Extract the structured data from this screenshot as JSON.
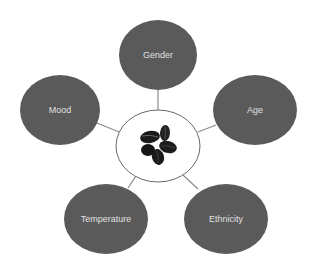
{
  "diagram": {
    "type": "hub-and-spoke",
    "center": {
      "label": "",
      "image": "coffee-beans"
    },
    "nodes": [
      {
        "id": "gender",
        "label": "Gender"
      },
      {
        "id": "age",
        "label": "Age"
      },
      {
        "id": "ethnicity",
        "label": "Ethnicity"
      },
      {
        "id": "temperature",
        "label": "Temperature"
      },
      {
        "id": "mood",
        "label": "Mood"
      }
    ],
    "colors": {
      "node_fill": "#5a5a5a",
      "node_text": "#e0e0e0",
      "connector": "#8c8c8c",
      "center_fill": "#ffffff",
      "center_stroke": "#6a6a6a",
      "bean": "#1a1a1a"
    }
  }
}
